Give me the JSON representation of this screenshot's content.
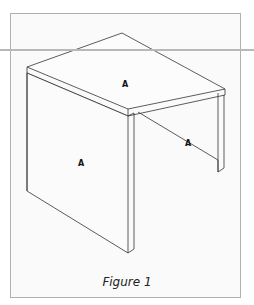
{
  "figure": {
    "caption": "Figure 1",
    "labels": [
      {
        "id": "top-surface",
        "text": "A"
      },
      {
        "id": "left-panel",
        "text": "A"
      },
      {
        "id": "right-panel",
        "text": "A"
      }
    ],
    "colors": {
      "line": "#333333",
      "frame_border": "#b0b0b0",
      "frame_fill": "#fafafa",
      "rule": "#b8b8b8"
    }
  }
}
